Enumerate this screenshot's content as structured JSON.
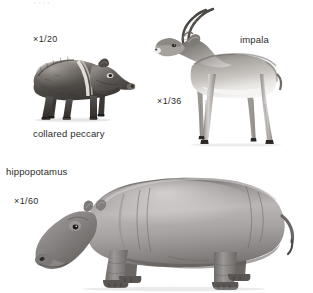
{
  "plate": {
    "background_color": "#ffffff",
    "ink_color": "#2b2b2b",
    "cut_off_header": ",       ,       ,        ,",
    "style": "grayscale scientific illustration plate"
  },
  "figures": [
    {
      "id": "collared-peccary",
      "common_name": "collared peccary",
      "scale_label": "×1/20",
      "scale_multiplier": "×",
      "scale_fraction": "1/20",
      "facing": "right",
      "name_label_position": "below",
      "scale_label_position": "above-left"
    },
    {
      "id": "impala",
      "common_name": "impala",
      "scale_label": "×1/36",
      "scale_multiplier": "×",
      "scale_fraction": "1/36",
      "facing": "left",
      "name_label_position": "upper-right",
      "scale_label_position": "lower-left"
    },
    {
      "id": "hippopotamus",
      "common_name": "hippopotamus",
      "scale_label": "×1/60",
      "scale_multiplier": "×",
      "scale_fraction": "1/60",
      "facing": "left",
      "name_label_position": "upper-left",
      "scale_label_position": "upper-left-below-name"
    }
  ],
  "labels": {
    "peccary_name": "collared peccary",
    "peccary_scale": "×1/20",
    "impala_name": "impala",
    "impala_scale": "×1/36",
    "hippo_name": "hippopotamus",
    "hippo_scale": "×1/60"
  },
  "colors": {
    "page": "#ffffff",
    "text": "#2b2b2b",
    "ink_dark": "#4a4a4a",
    "ink_mid": "#8a8a8a",
    "ink_light": "#c9c9c9",
    "highlight": "#f2f2f2"
  }
}
